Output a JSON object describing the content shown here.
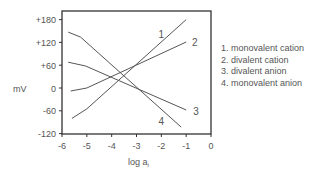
{
  "chart_data": {
    "type": "line",
    "title": "",
    "xlabel": "log a",
    "xlabel_subscript": "i",
    "ylabel": "mV",
    "xlim": [
      -6,
      0
    ],
    "ylim": [
      -120,
      200
    ],
    "x_ticks": [
      -6,
      -5,
      -4,
      -3,
      -2,
      -1,
      0
    ],
    "x_tick_labels": [
      "-6",
      "-5",
      "-4",
      "-3",
      "-2",
      "-1",
      "0"
    ],
    "y_ticks": [
      180,
      120,
      60,
      0,
      -60,
      -120
    ],
    "y_tick_labels": [
      "+180",
      "+120",
      "+60",
      "0",
      "-60",
      "-120"
    ],
    "grid": false,
    "legend_position": "right",
    "series": [
      {
        "id": "1",
        "name": "monovalent cation",
        "x": [
          -5.6,
          -5.0,
          -1.0
        ],
        "y": [
          -80,
          -55,
          180
        ]
      },
      {
        "id": "2",
        "name": "divalent cation",
        "x": [
          -5.65,
          -5.0,
          -1.0
        ],
        "y": [
          -8,
          0,
          121
        ]
      },
      {
        "id": "3",
        "name": "divalent anion",
        "x": [
          -5.75,
          -5.05,
          -1.0
        ],
        "y": [
          68,
          58,
          -58
        ]
      },
      {
        "id": "4",
        "name": "monovalent anion",
        "x": [
          -5.75,
          -5.25,
          -1.2
        ],
        "y": [
          147,
          134,
          -103
        ]
      }
    ],
    "line_labels": [
      {
        "text": "1",
        "x": -2.0,
        "y": 142
      },
      {
        "text": "2",
        "x": -0.65,
        "y": 120
      },
      {
        "text": "3",
        "x": -0.6,
        "y": -62
      },
      {
        "text": "4",
        "x": -2.0,
        "y": -87
      }
    ]
  },
  "legend": {
    "items": [
      "1. monovalent cation",
      "2. divalent cation",
      "3. divalent anion",
      "4. monovalent anion"
    ]
  },
  "colors": {
    "axis": "#333333",
    "line": "#555555",
    "text": "#555555"
  }
}
